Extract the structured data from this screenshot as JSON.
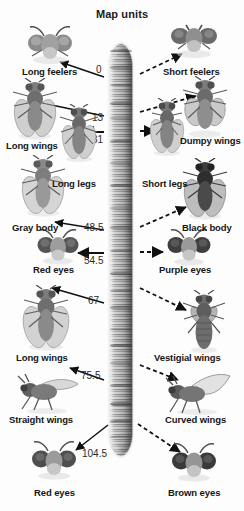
{
  "title": "Map units",
  "chromosome": {
    "name": "drosophila-chromosome",
    "band_positions": [
      6,
      22,
      40,
      58,
      73,
      96,
      118,
      140,
      163,
      182,
      206,
      228,
      246,
      262,
      284,
      300,
      318,
      340,
      358,
      376,
      392
    ]
  },
  "map_units": [
    {
      "value": "0",
      "trait_left": "Long feelers",
      "trait_right": "Short feelers"
    },
    {
      "value": "13",
      "trait_left": "Long wings",
      "trait_right": "Dumpy wings"
    },
    {
      "value": "31",
      "trait_left": "Long legs",
      "trait_right": "Short legs"
    },
    {
      "value": "48.5",
      "trait_left": "Gray body",
      "trait_right": "Black body"
    },
    {
      "value": "54.5",
      "trait_left": "Red eyes",
      "trait_right": "Purple eyes"
    },
    {
      "value": "67",
      "trait_left": "Long wings",
      "trait_right": "Vestigial wings"
    },
    {
      "value": "75.5",
      "trait_left": "Straight wings",
      "trait_right": "Curved wings"
    },
    {
      "value": "104.5",
      "trait_left": "Red eyes",
      "trait_right": "Brown eyes"
    }
  ],
  "labels": {
    "left": [
      "Long feelers",
      "Long wings",
      "Long legs",
      "Gray body",
      "Red eyes",
      "Long wings",
      "Straight wings",
      "Red eyes"
    ],
    "right": [
      "Short feelers",
      "Dumpy wings",
      "Short legs",
      "Black body",
      "Purple eyes",
      "Vestigial wings",
      "Curved wings",
      "Brown eyes"
    ]
  },
  "units_text": {
    "u0": "0",
    "u13": "13",
    "u31": "31",
    "u485": "48.5",
    "u545": "54.5",
    "u67": "67",
    "u755": "75.5",
    "u1045": "104.5"
  },
  "colors": {
    "background": "#ffffff",
    "text": "#161616",
    "unit_text": "#2a2a2a",
    "arrow": "#111111",
    "chromosome_dark": "#6f6f6f",
    "chromosome_light": "#cfcfcf"
  }
}
